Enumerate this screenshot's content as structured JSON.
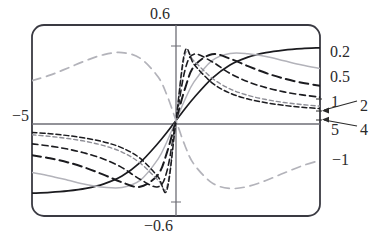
{
  "figure": {
    "kind": "line-plot",
    "background": "#ffffff",
    "frame": {
      "x0": 32,
      "y0": 25,
      "x1": 320,
      "y1": 216,
      "corner_radius": 12,
      "color": "#3a3a42",
      "width": 1.8
    },
    "origin": {
      "x": 176,
      "y": 124
    }
  },
  "labels": {
    "top": "0.6",
    "bottom": "−0.6",
    "left": "−5",
    "right_02": "0.2",
    "right_05": "0.5",
    "right_1": "1",
    "right_2": "2",
    "right_4": "4",
    "right_5": "5",
    "right_m1": "−1"
  },
  "colors": {
    "frame": "#3a3a42",
    "axis": "#6e6e76",
    "dark": "#1b1b1f",
    "light": "#b3b3ba",
    "mid": "#8e8e96",
    "text": "#2b2b2b"
  },
  "chart_data": {
    "type": "line",
    "title": "",
    "xlabel": "",
    "ylabel": "",
    "xlim": [
      -8.0,
      8.0
    ],
    "ylim": [
      -0.72,
      0.72
    ],
    "grid": false,
    "legend": "right-edge-labels",
    "xticks": [
      -5,
      5
    ],
    "xticklabels": [
      "−5",
      "5"
    ],
    "yticks": [
      -0.6,
      0.6
    ],
    "yticklabels": [
      "−0.6",
      "0.6"
    ],
    "axis_lines": {
      "x_axis_at_y": 0,
      "y_axis_at_x": 0
    },
    "annotations": [
      {
        "text": "2",
        "points_to_series": "2",
        "at_x": 8.0
      },
      {
        "text": "4",
        "points_to_series": "4",
        "at_x": 8.0
      }
    ],
    "series": [
      {
        "name": "0.2",
        "label": "0.2",
        "style": "solid",
        "color": "#1b1b1f",
        "width": 1.7,
        "dash": "none",
        "shape": "odd-symmetric sigmoid, slowest rise, saturates at +/-0.55",
        "amplitude": 0.55,
        "rate": 0.22,
        "x": [
          -8,
          -7,
          -6,
          -5,
          -4,
          -3,
          -2,
          -1,
          -0.5,
          0,
          0.5,
          1,
          2,
          3,
          4,
          5,
          6,
          7,
          8
        ],
        "y": [
          -0.548,
          -0.542,
          -0.531,
          -0.512,
          -0.478,
          -0.419,
          -0.318,
          -0.172,
          -0.089,
          0,
          0.089,
          0.172,
          0.318,
          0.419,
          0.478,
          0.512,
          0.531,
          0.542,
          0.548
        ]
      },
      {
        "name": "0.5",
        "label": "0.5",
        "style": "solid",
        "color": "#b3b3ba",
        "width": 1.5,
        "dash": "none",
        "shape": "odd-symmetric, rises faster then slight decline toward edges",
        "amplitude": 0.5,
        "rate": 0.55,
        "x": [
          -8,
          -7,
          -6,
          -5,
          -4,
          -3,
          -2,
          -1,
          -0.5,
          0,
          0.5,
          1,
          2,
          3,
          4,
          5,
          6,
          7,
          8
        ],
        "y": [
          -0.392,
          -0.418,
          -0.45,
          -0.482,
          -0.503,
          -0.505,
          -0.452,
          -0.291,
          -0.158,
          0,
          0.158,
          0.291,
          0.452,
          0.505,
          0.503,
          0.482,
          0.45,
          0.418,
          0.392
        ]
      },
      {
        "name": "1",
        "label": "1",
        "style": "dashed-long",
        "color": "#1b1b1f",
        "width": 2.0,
        "dash": "9,5",
        "shape": "odd-symmetric, peak near x=2.6 then decays",
        "amplitude": 0.52,
        "rate": 1.0,
        "x": [
          -8,
          -7,
          -6,
          -5,
          -4,
          -3,
          -2,
          -1,
          -0.5,
          0,
          0.5,
          1,
          2,
          3,
          4,
          5,
          6,
          7,
          8
        ],
        "y": [
          -0.262,
          -0.285,
          -0.316,
          -0.358,
          -0.41,
          -0.466,
          -0.5,
          -0.408,
          -0.24,
          0,
          0.24,
          0.408,
          0.5,
          0.466,
          0.41,
          0.358,
          0.316,
          0.285,
          0.262
        ]
      },
      {
        "name": "2",
        "label": "2",
        "style": "dashed-medium",
        "color": "#1b1b1f",
        "width": 1.6,
        "dash": "6,4",
        "shape": "odd-symmetric, steeper core, peak near x=1.4",
        "amplitude": 0.52,
        "rate": 2.0,
        "x": [
          -8,
          -7,
          -6,
          -5,
          -4,
          -3,
          -2,
          -1,
          -0.5,
          0,
          0.5,
          1,
          2,
          3,
          4,
          5,
          6,
          7,
          8
        ],
        "y": [
          -0.176,
          -0.193,
          -0.216,
          -0.248,
          -0.292,
          -0.355,
          -0.443,
          -0.5,
          -0.38,
          0,
          0.38,
          0.5,
          0.443,
          0.355,
          0.292,
          0.248,
          0.216,
          0.193,
          0.176
        ]
      },
      {
        "name": "4",
        "label": "4",
        "style": "dashed-short",
        "color": "#8e8e96",
        "width": 1.4,
        "dash": "4,3",
        "shape": "odd-symmetric, very steep core, peak near x=0.8",
        "amplitude": 0.5,
        "rate": 4.0,
        "x": [
          -8,
          -7,
          -6,
          -5,
          -4,
          -3,
          -2,
          -1,
          -0.5,
          0,
          0.5,
          1,
          2,
          3,
          4,
          5,
          6,
          7,
          8
        ],
        "y": [
          -0.108,
          -0.12,
          -0.136,
          -0.158,
          -0.19,
          -0.238,
          -0.32,
          -0.448,
          -0.498,
          0,
          0.498,
          0.448,
          0.32,
          0.238,
          0.19,
          0.158,
          0.136,
          0.12,
          0.108
        ]
      },
      {
        "name": "5",
        "label": "5",
        "style": "dashed-short",
        "color": "#1b1b1f",
        "width": 1.5,
        "dash": "5,3",
        "shape": "odd-symmetric, steepest core, peak near x=0.6",
        "amplitude": 0.52,
        "rate": 5.5,
        "x": [
          -8,
          -7,
          -6,
          -5,
          -4,
          -3,
          -2,
          -1,
          -0.5,
          0,
          0.5,
          1,
          2,
          3,
          4,
          5,
          6,
          7,
          8
        ],
        "y": [
          -0.09,
          -0.1,
          -0.114,
          -0.134,
          -0.162,
          -0.206,
          -0.284,
          -0.424,
          -0.522,
          0,
          0.522,
          0.424,
          0.284,
          0.206,
          0.162,
          0.134,
          0.114,
          0.1,
          0.09
        ]
      },
      {
        "name": "-1",
        "label": "−1",
        "style": "dashed-long",
        "color": "#b3b3ba",
        "width": 1.7,
        "dash": "9,6",
        "shape": "inverted odd-symmetric: negative lobe for x>0, dips to -0.50 near x=3 then rises",
        "amplitude": 0.5,
        "rate": -1.0,
        "x": [
          -8,
          -7,
          -6,
          -5,
          -4,
          -3,
          -2,
          -1,
          -0.5,
          0,
          0.5,
          1,
          2,
          3,
          4,
          5,
          6,
          7,
          8
        ],
        "y": [
          0.3,
          0.342,
          0.396,
          0.452,
          0.497,
          0.512,
          0.47,
          0.33,
          0.19,
          0,
          -0.19,
          -0.33,
          -0.47,
          -0.512,
          -0.497,
          -0.452,
          -0.396,
          -0.342,
          -0.3
        ]
      }
    ]
  }
}
